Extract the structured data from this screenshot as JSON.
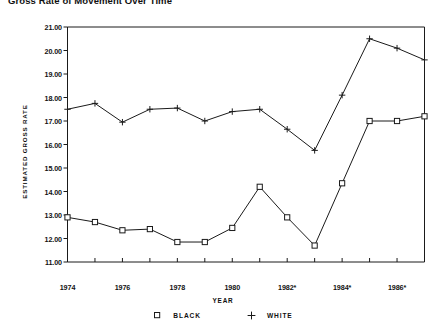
{
  "chart_data": {
    "type": "line",
    "title": "Gross Rate of Movement Over Time",
    "xlabel": "YEAR",
    "ylabel": "ESTIMATED GROSS RATE",
    "x": [
      1974,
      1975,
      1976,
      1977,
      1978,
      1979,
      1980,
      1981,
      1982,
      1983,
      1984,
      1985,
      1986,
      1987
    ],
    "xlim": [
      1974,
      1987
    ],
    "ylim": [
      11.0,
      21.0
    ],
    "grid": false,
    "legend_position": "bottom-center",
    "xtick_labels": [
      "1974",
      "1976",
      "1978",
      "1980",
      "1982*",
      "1984*",
      "1986*"
    ],
    "xtick_values": [
      1974,
      1976,
      1978,
      1980,
      1982,
      1984,
      1986
    ],
    "ytick_labels": [
      "21.00",
      "20.00",
      "19.00",
      "18.00",
      "17.00",
      "16.00",
      "15.00",
      "14.00",
      "13.00",
      "12.00",
      "11.00"
    ],
    "ytick_values": [
      21.0,
      20.0,
      19.0,
      18.0,
      17.0,
      16.0,
      15.0,
      14.0,
      13.0,
      12.0,
      11.0
    ],
    "series": [
      {
        "name": "BLACK",
        "marker": "square",
        "values": [
          12.9,
          12.7,
          12.35,
          12.4,
          11.85,
          11.85,
          12.45,
          14.2,
          12.9,
          11.7,
          14.35,
          17.0,
          17.0,
          17.2
        ]
      },
      {
        "name": "WHITE",
        "marker": "plus",
        "values": [
          17.5,
          17.75,
          16.95,
          17.5,
          17.55,
          17.0,
          17.4,
          17.5,
          16.65,
          15.75,
          18.1,
          20.5,
          20.1,
          19.6
        ]
      }
    ]
  },
  "legend": {
    "entries": [
      {
        "label": "BLACK",
        "marker": "square-marker"
      },
      {
        "label": "WHITE",
        "marker": "plus-marker"
      }
    ]
  }
}
